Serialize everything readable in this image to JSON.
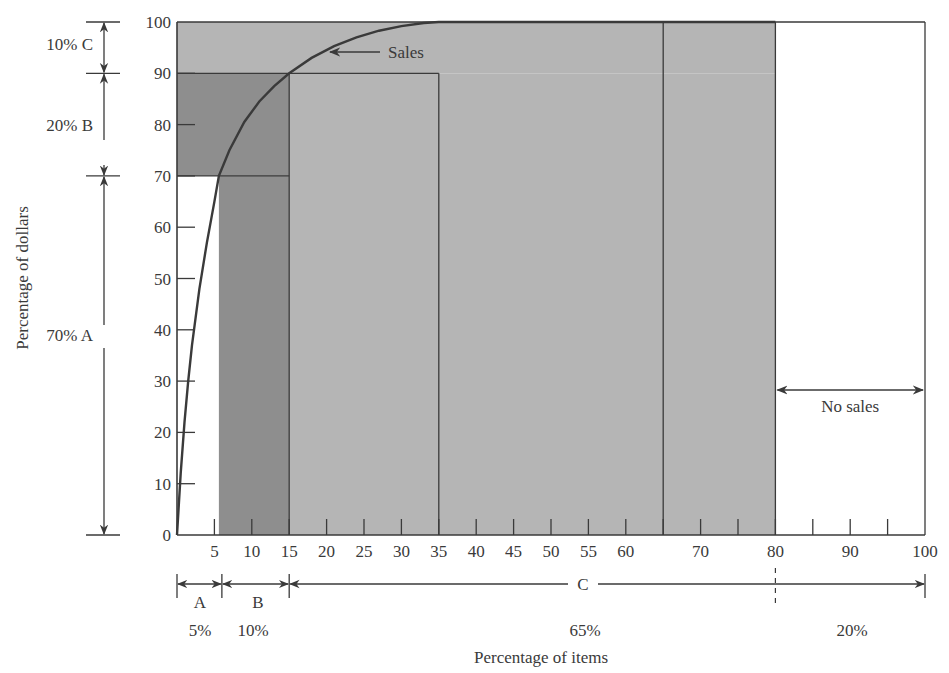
{
  "chart_data": {
    "type": "line",
    "title": "",
    "subtitle": "",
    "xlabel": "Percentage of items",
    "ylabel": "Percentage of dollars",
    "xlim": [
      0,
      100
    ],
    "ylim": [
      0,
      100
    ],
    "grid": false,
    "legend": "none",
    "x_ticks": [
      5,
      10,
      15,
      20,
      25,
      30,
      35,
      40,
      45,
      50,
      55,
      60,
      70,
      80,
      90,
      100
    ],
    "x_minor_ticks": [
      65,
      75,
      85,
      95
    ],
    "y_ticks": [
      0,
      10,
      20,
      30,
      40,
      50,
      60,
      70,
      80,
      90,
      100
    ],
    "series": [
      {
        "name": "Sales",
        "x": [
          0,
          0.5,
          1,
          1.5,
          2,
          3,
          4,
          5,
          5.6,
          7,
          9,
          11,
          13,
          15,
          18,
          21,
          24,
          27,
          30,
          33,
          35,
          40,
          50,
          60,
          70,
          80
        ],
        "y": [
          0,
          12,
          22,
          30,
          37,
          48,
          57,
          65,
          70,
          75,
          80.5,
          84.5,
          87.5,
          90,
          93,
          95.3,
          97,
          98.3,
          99.2,
          99.8,
          100,
          100,
          100,
          100,
          100,
          100
        ]
      }
    ],
    "regions": [
      {
        "name": "A",
        "x": [
          0,
          5
        ],
        "y": [
          0,
          70
        ],
        "items_pct": "5%",
        "dollars_pct": "70%"
      },
      {
        "name": "B",
        "x": [
          5,
          15
        ],
        "y": [
          70,
          90
        ],
        "items_pct": "10%",
        "dollars_pct": "20%"
      },
      {
        "name": "C",
        "x": [
          15,
          80
        ],
        "y": [
          90,
          100
        ],
        "items_pct": "65%",
        "dollars_pct": "10%"
      },
      {
        "name": "No sales",
        "x": [
          80,
          100
        ],
        "y": [
          0,
          0
        ],
        "items_pct": "20%",
        "dollars_pct": "0%"
      }
    ],
    "shaded_rects": [
      {
        "x0": 0,
        "x1": 80,
        "y0": 90,
        "y1": 100,
        "shade": "light"
      },
      {
        "x0": 0,
        "x1": 15,
        "y0": 70,
        "y1": 90,
        "shade": "dark"
      },
      {
        "x0": 5.6,
        "x1": 15,
        "y0": 0,
        "y1": 70,
        "shade": "dark"
      },
      {
        "x0": 15,
        "x1": 80,
        "y0": 0,
        "y1": 90,
        "shade": "light"
      }
    ],
    "divider_lines_x": [
      15,
      35,
      65,
      80
    ],
    "box_35_top": 90,
    "annotations": [
      {
        "text": "Sales",
        "x": 28,
        "y": 97,
        "arrow_to": [
          20.5,
          94.5
        ]
      },
      {
        "text": "No sales",
        "x": 90,
        "y": 25,
        "arrow_span": [
          80,
          100
        ]
      }
    ],
    "left_brackets": [
      {
        "label": "10% C",
        "y0": 90,
        "y1": 100
      },
      {
        "label": "20% B",
        "y0": 70,
        "y1": 90
      },
      {
        "label": "70% A",
        "y0": 0,
        "y1": 70
      }
    ],
    "bottom_brackets": [
      {
        "label": "A",
        "pct": "5%",
        "x0": 0,
        "x1": 6
      },
      {
        "label": "B",
        "pct": "10%",
        "x0": 6,
        "x1": 15
      },
      {
        "label": "C",
        "pct": "65%",
        "x0": 15,
        "x1": 100
      },
      {
        "label": "",
        "pct": "20%",
        "x0": 80,
        "x1": 100
      }
    ],
    "colors": {
      "dark_shade": "#8e8e8e",
      "light_shade": "#b5b5b5",
      "line": "#3a3a3a",
      "text": "#3a3a3a"
    }
  },
  "labels": {
    "ylabel": "Percentage of dollars",
    "xlabel": "Percentage of items",
    "sales": "Sales",
    "no_sales": "No sales",
    "left_c": "10% C",
    "left_b": "20% B",
    "left_a": "70% A",
    "bottom_a": "A",
    "bottom_b": "B",
    "bottom_c": "C",
    "pct_a": "5%",
    "pct_b": "10%",
    "pct_c": "65%",
    "pct_none": "20%"
  }
}
